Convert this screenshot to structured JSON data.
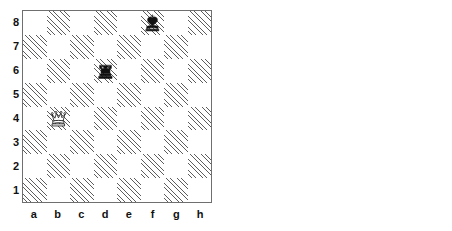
{
  "figure": {
    "type": "chess-diagram-pair",
    "count": 2
  },
  "labels": {
    "files": [
      "a",
      "b",
      "c",
      "d",
      "e",
      "f",
      "g",
      "h"
    ],
    "ranks": [
      "8",
      "7",
      "6",
      "5",
      "4",
      "3",
      "2",
      "1"
    ]
  },
  "colors": {
    "light_square": "#ffffff",
    "dark_square_hatch": "#5d5d5d",
    "board_border": "#6f6f6f",
    "label_text": "#111111",
    "piece_black": "#111111",
    "piece_white_fill": "#ffffff",
    "piece_outline": "#111111",
    "page_background": "#ffffff"
  },
  "boards": [
    {
      "id": "board-left",
      "name": "left-chess-diagram",
      "orientation": "white-bottom",
      "pieces": [
        {
          "square": "f8",
          "color": "black",
          "type": "king",
          "glyph": "♚",
          "name": "black-king-f8"
        },
        {
          "square": "d6",
          "color": "black",
          "type": "rook",
          "glyph": "♜",
          "name": "black-rook-d6"
        },
        {
          "square": "b4",
          "color": "white",
          "type": "queen",
          "glyph": "♕",
          "name": "white-queen-b4"
        }
      ]
    },
    {
      "id": "board-right",
      "name": "right-chess-diagram",
      "orientation": "white-bottom",
      "pieces": [
        {
          "square": "g4",
          "color": "black",
          "type": "bishop",
          "glyph": "♝",
          "name": "black-bishop-g4"
        },
        {
          "square": "f3",
          "color": "white",
          "type": "knight",
          "glyph": "♘",
          "name": "white-knight-f3"
        },
        {
          "square": "d1",
          "color": "white",
          "type": "queen",
          "glyph": "♕",
          "name": "white-queen-d1"
        }
      ]
    }
  ]
}
